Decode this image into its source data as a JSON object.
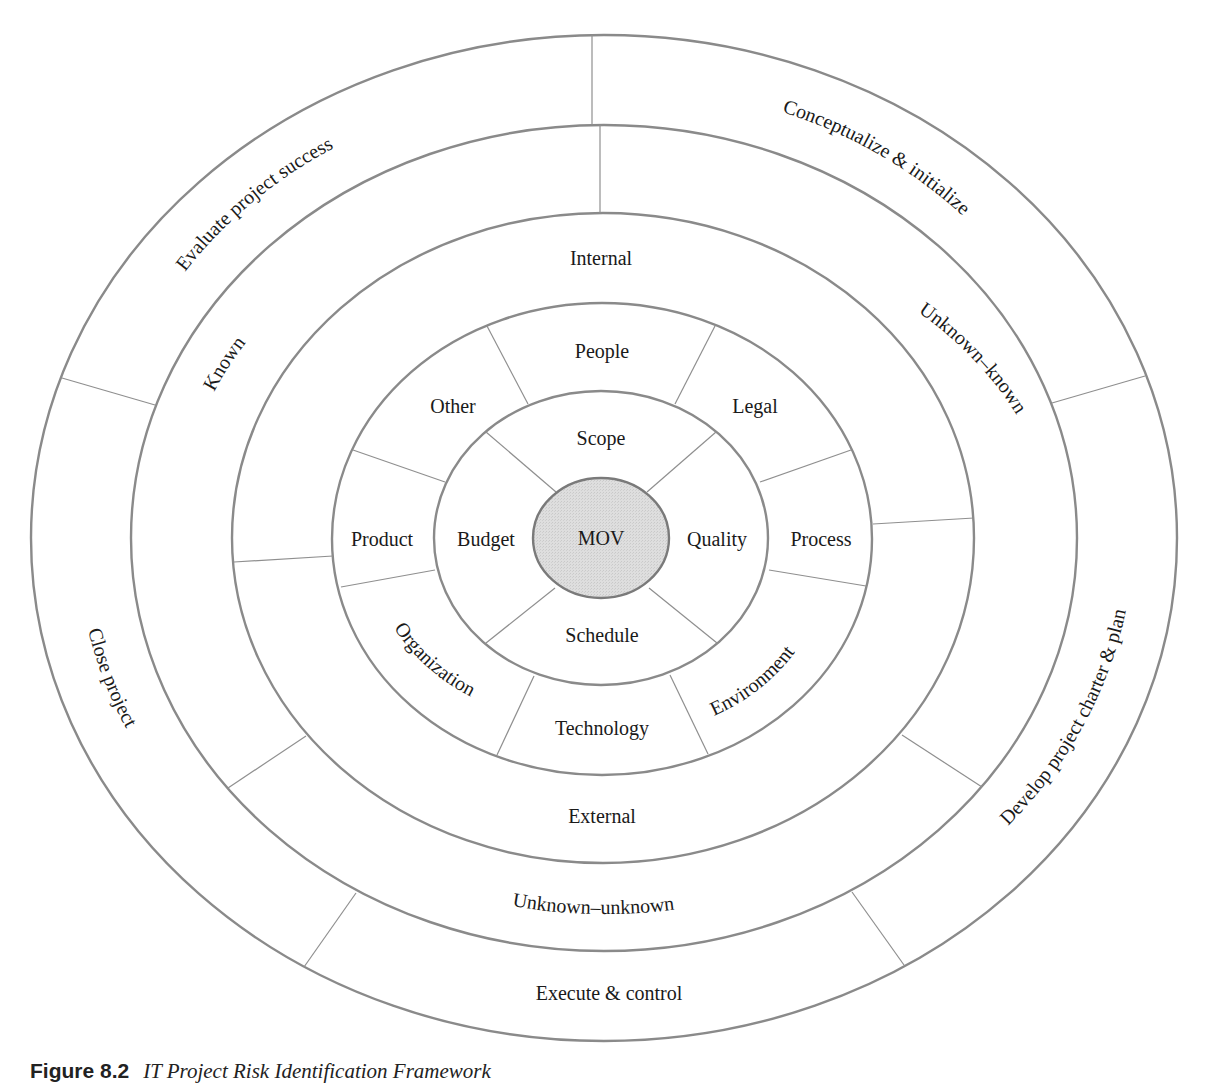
{
  "figure": {
    "type": "concentric-ring-diagram",
    "center": {
      "label": "MOV",
      "fill": "#dcdcdc"
    },
    "rings": [
      {
        "name": "project-life-cycle",
        "level": 5,
        "segments": [
          {
            "label": "Evaluate project success"
          },
          {
            "label": "Conceptualize & initialize"
          },
          {
            "label": "Develop project charter & plan"
          },
          {
            "label": "Execute & control"
          },
          {
            "label": "Close project"
          }
        ]
      },
      {
        "name": "knowledge",
        "level": 4,
        "segments": [
          {
            "label": "Known"
          },
          {
            "label": "Unknown–known"
          },
          {
            "label": "Unknown–unknown"
          }
        ]
      },
      {
        "name": "source",
        "level": 3,
        "segments": [
          {
            "label": "Internal"
          },
          {
            "label": "External"
          }
        ]
      },
      {
        "name": "sphere",
        "level": 2,
        "segments": [
          {
            "label": "People"
          },
          {
            "label": "Legal"
          },
          {
            "label": "Process"
          },
          {
            "label": "Environment"
          },
          {
            "label": "Technology"
          },
          {
            "label": "Organization"
          },
          {
            "label": "Product"
          },
          {
            "label": "Other"
          }
        ]
      },
      {
        "name": "project-objectives",
        "level": 1,
        "segments": [
          {
            "label": "Scope"
          },
          {
            "label": "Quality"
          },
          {
            "label": "Schedule"
          },
          {
            "label": "Budget"
          }
        ]
      }
    ],
    "stroke_color": "#8a8a8a",
    "text_color": "#1a1a1a"
  },
  "caption": {
    "number": "Figure 8.2",
    "text": "IT Project Risk Identification Framework"
  }
}
